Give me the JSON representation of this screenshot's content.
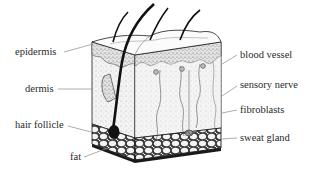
{
  "diagram": {
    "labels_left": [
      {
        "id": "epidermis",
        "text": "epidermis",
        "x": 15,
        "y": 46,
        "anchor": [
          93,
          44
        ],
        "from": [
          64,
          52
        ]
      },
      {
        "id": "dermis",
        "text": "dermis",
        "x": 25,
        "y": 83,
        "anchor": [
          93,
          89
        ],
        "from": [
          58,
          89
        ]
      },
      {
        "id": "hair-follicle",
        "text": "hair follicle",
        "x": 15,
        "y": 119,
        "anchor": [
          91,
          132
        ],
        "from": [
          68,
          126
        ]
      },
      {
        "id": "fat",
        "text": "fat",
        "x": 70,
        "y": 151,
        "anchor": [
          108,
          148
        ],
        "from": [
          84,
          157
        ]
      }
    ],
    "labels_right": [
      {
        "id": "blood-vessel",
        "text": "blood vessel",
        "x": 240,
        "y": 49,
        "anchor": [
          222,
          64
        ],
        "from": [
          237,
          55
        ]
      },
      {
        "id": "sensory-nerve",
        "text": "sensory nerve",
        "x": 240,
        "y": 79,
        "anchor": [
          222,
          96
        ],
        "from": [
          237,
          86
        ]
      },
      {
        "id": "fibroblasts",
        "text": "fibroblasts",
        "x": 240,
        "y": 104,
        "anchor": [
          222,
          113
        ],
        "from": [
          237,
          110
        ]
      },
      {
        "id": "sweat-gland",
        "text": "sweat gland",
        "x": 240,
        "y": 132,
        "anchor": [
          222,
          139
        ],
        "from": [
          237,
          138
        ]
      }
    ],
    "colors": {
      "ink": "#1a1a1a",
      "label": "#2a2a2a",
      "leader": "#8a8a8a",
      "dermis_fill": "#f1f1f1",
      "epidermis_fill": "#d9d9d9",
      "fat_fill": "#e9e9e9",
      "background": "#ffffff"
    }
  }
}
